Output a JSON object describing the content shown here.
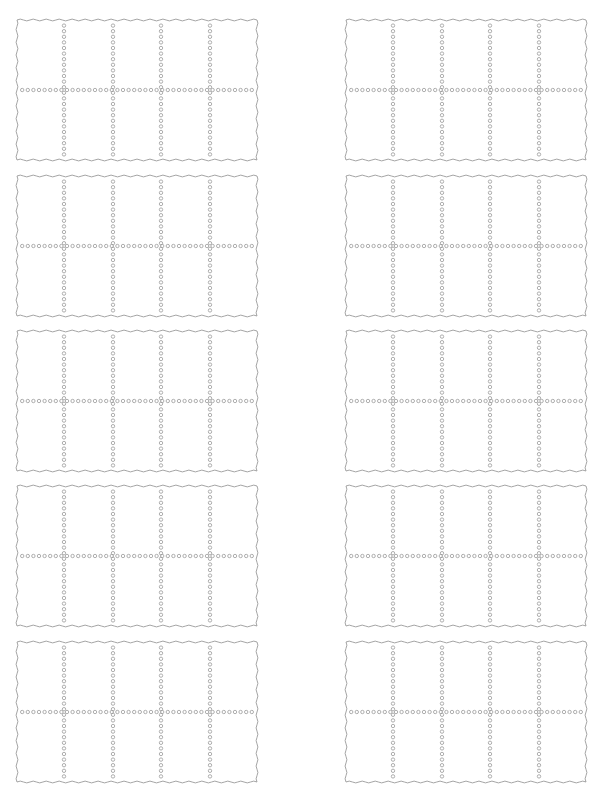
{
  "page": {
    "type": "printable-template-sheet",
    "background": "#ffffff",
    "line_color": "#9a9a9a"
  },
  "layout": {
    "columns": 2,
    "rows": 5,
    "card_width": 242,
    "card_height": 142,
    "column_x": [
      16,
      345
    ],
    "row_y": [
      19,
      175,
      330,
      485,
      641
    ]
  },
  "card_template": {
    "border_style": "wavy",
    "divider_style": "dotted-circles",
    "grid_columns": 5,
    "grid_rows": 2,
    "vertical_dividers_fraction": [
      0.2,
      0.4,
      0.6,
      0.8
    ],
    "horizontal_divider_fraction": [
      0.5
    ]
  },
  "cards": [
    {
      "id": "card-1",
      "row": 1,
      "col": 1
    },
    {
      "id": "card-2",
      "row": 1,
      "col": 2
    },
    {
      "id": "card-3",
      "row": 2,
      "col": 1
    },
    {
      "id": "card-4",
      "row": 2,
      "col": 2
    },
    {
      "id": "card-5",
      "row": 3,
      "col": 1
    },
    {
      "id": "card-6",
      "row": 3,
      "col": 2
    },
    {
      "id": "card-7",
      "row": 4,
      "col": 1
    },
    {
      "id": "card-8",
      "row": 4,
      "col": 2
    },
    {
      "id": "card-9",
      "row": 5,
      "col": 1
    },
    {
      "id": "card-10",
      "row": 5,
      "col": 2
    }
  ]
}
